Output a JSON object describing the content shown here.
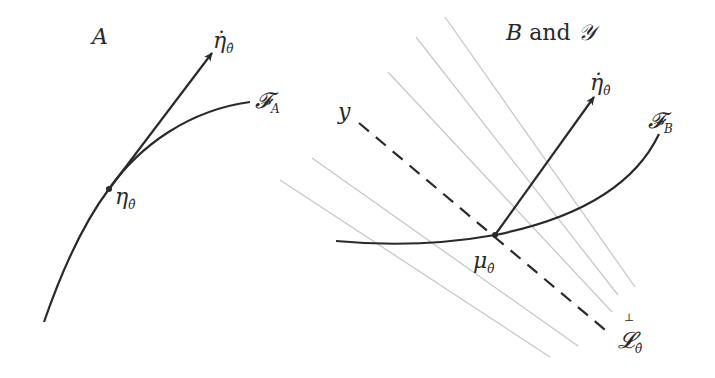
{
  "panel_a": {
    "title": "A",
    "curve_label_main": "𝓕",
    "curve_label_sub": "A",
    "point_label_main": "η",
    "point_label_sub": "θ̂",
    "arrow_label_main": "η̇",
    "arrow_label_sub": "θ̂"
  },
  "panel_b": {
    "title_b": "B",
    "title_and": " and ",
    "title_y": "𝒴",
    "curve_label_main": "𝓕",
    "curve_label_sub": "B",
    "point_label_main": "μ",
    "point_label_sub": "θ̂",
    "arrow_label_main": "η̇",
    "arrow_label_sub": "θ̂",
    "y_label": "y",
    "line_label_perp": "⊥",
    "line_label_main": "𝓛",
    "line_label_sub": "θ̂"
  },
  "colors": {
    "ink": "#2a2a2a",
    "gray_lines": "#c8c8c8"
  }
}
